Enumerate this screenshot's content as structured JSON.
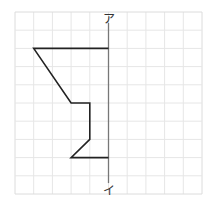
{
  "diagram": {
    "type": "line-symmetry-figure",
    "grid": {
      "cols": 10,
      "rows": 10,
      "left": 15,
      "top": 12,
      "cell_w": 18.7,
      "cell_h": 18.2,
      "line_color": "#e6e6e6",
      "border_color": "#dcdcdc"
    },
    "axis": {
      "col": 5,
      "from_row": -0.2,
      "to_row": 10,
      "color": "#777777",
      "label_top": "ア",
      "label_bottom": "イ"
    },
    "shape": {
      "color": "#222222",
      "points": [
        [
          5,
          2
        ],
        [
          1,
          2
        ],
        [
          3,
          5
        ],
        [
          4,
          5
        ],
        [
          4,
          7
        ],
        [
          3,
          8
        ],
        [
          5,
          8
        ]
      ]
    }
  }
}
